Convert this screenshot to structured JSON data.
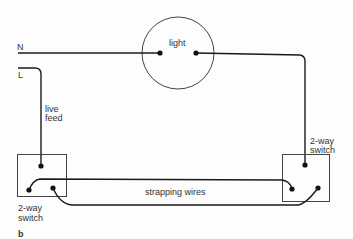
{
  "diagram": {
    "type": "wiring",
    "figure_label": "b",
    "labels": {
      "neutral": "N",
      "live": "L",
      "light": "light",
      "live_feed_line1": "live",
      "live_feed_line2": "feed",
      "left_switch_line1": "2-way",
      "left_switch_line2": "switch",
      "right_switch_line1": "2-way",
      "right_switch_line2": "switch",
      "strapping": "strapping wires"
    },
    "colors": {
      "wire": "#1a1a1a",
      "outline": "#444444",
      "text": "#333333",
      "background": "#fdfdfd"
    },
    "components": [
      {
        "id": "light",
        "kind": "lamp",
        "terminals": 2
      },
      {
        "id": "left-switch",
        "kind": "2-way switch",
        "terminals": 3
      },
      {
        "id": "right-switch",
        "kind": "2-way switch",
        "terminals": 3
      }
    ],
    "connections": [
      {
        "from": "N",
        "to": "light.left"
      },
      {
        "from": "L",
        "to": "left-switch.common",
        "label": "live feed"
      },
      {
        "from": "light.right",
        "to": "right-switch.common"
      },
      {
        "from": "left-switch.L1",
        "to": "right-switch.L1",
        "label": "strapping wires"
      },
      {
        "from": "left-switch.L2",
        "to": "right-switch.L2",
        "label": "strapping wires"
      }
    ]
  }
}
